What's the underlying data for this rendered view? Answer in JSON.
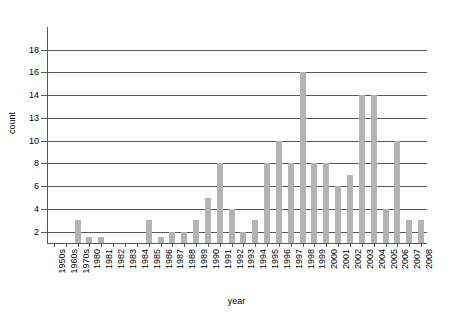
{
  "chart_data": {
    "type": "bar",
    "title": "",
    "xlabel": "year",
    "ylabel": "count",
    "grid": true,
    "legend": null,
    "bar_color": "#b3b3b3",
    "axis_color": "#58585a",
    "ytick_labels": [
      "2",
      "4",
      "6",
      "8",
      "10",
      "13",
      "14",
      "16",
      "18"
    ],
    "ytick_values": [
      2,
      4,
      6,
      8,
      10,
      13,
      14,
      16,
      18
    ],
    "ylim": [
      0,
      18
    ],
    "categories": [
      "1950s",
      "1960s",
      "1970s",
      "1980",
      "1981",
      "1982",
      "1983",
      "1984",
      "1985",
      "1986",
      "1987",
      "1988",
      "1989",
      "1990",
      "1991",
      "1992",
      "1993",
      "1994",
      "1995",
      "1996",
      "1997",
      "1998",
      "1999",
      "2000",
      "2001",
      "2002",
      "2003",
      "2004",
      "2005",
      "2006",
      "2007",
      "2008"
    ],
    "values": [
      0,
      0,
      3,
      1,
      1,
      0,
      0,
      0,
      3,
      1,
      2,
      2,
      3,
      5,
      8,
      4,
      2,
      3,
      8,
      10,
      8,
      16,
      8,
      8,
      6,
      7,
      14,
      14,
      4,
      10,
      3,
      3
    ]
  }
}
